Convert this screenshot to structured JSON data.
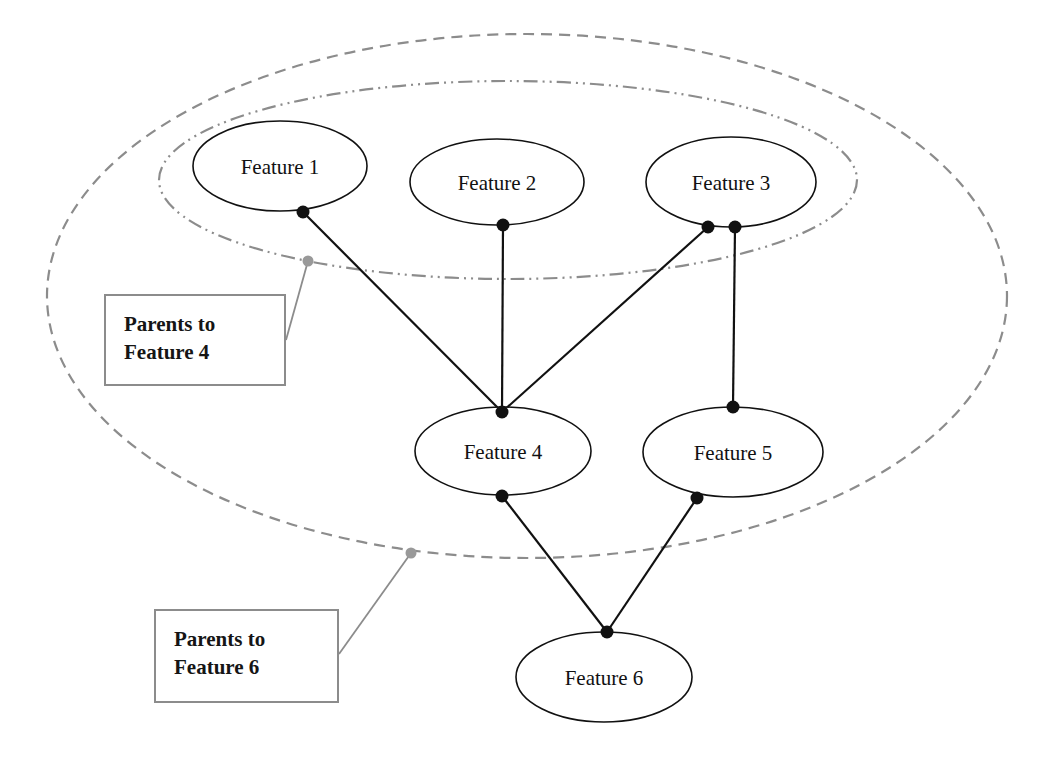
{
  "diagram": {
    "title": "",
    "nodes": [
      {
        "id": "f1",
        "label": "Feature 1",
        "cx": 280,
        "cy": 166,
        "rx": 87,
        "ry": 45
      },
      {
        "id": "f2",
        "label": "Feature 2",
        "cx": 497,
        "cy": 182,
        "rx": 87,
        "ry": 43
      },
      {
        "id": "f3",
        "label": "Feature 3",
        "cx": 731,
        "cy": 182,
        "rx": 85,
        "ry": 45
      },
      {
        "id": "f4",
        "label": "Feature 4",
        "cx": 503,
        "cy": 451,
        "rx": 88,
        "ry": 44
      },
      {
        "id": "f5",
        "label": "Feature 5",
        "cx": 733,
        "cy": 452,
        "rx": 90,
        "ry": 45
      },
      {
        "id": "f6",
        "label": "Feature 6",
        "cx": 604,
        "cy": 677,
        "rx": 88,
        "ry": 45
      }
    ],
    "edges": [
      {
        "from": "Feature 1",
        "to": "Feature 4",
        "x1": 303,
        "y1": 212,
        "x2": 502,
        "y2": 412
      },
      {
        "from": "Feature 2",
        "to": "Feature 4",
        "x1": 503,
        "y1": 225,
        "x2": 502,
        "y2": 412
      },
      {
        "from": "Feature 3",
        "to": "Feature 4",
        "x1": 708,
        "y1": 227,
        "x2": 502,
        "y2": 412
      },
      {
        "from": "Feature 3",
        "to": "Feature 5",
        "x1": 735,
        "y1": 227,
        "x2": 733,
        "y2": 407
      },
      {
        "from": "Feature 4",
        "to": "Feature 6",
        "x1": 502,
        "y1": 496,
        "x2": 607,
        "y2": 632
      },
      {
        "from": "Feature 5",
        "to": "Feature 6",
        "x1": 697,
        "y1": 498,
        "x2": 607,
        "y2": 632
      }
    ],
    "ports": [
      {
        "x": 303,
        "y": 212
      },
      {
        "x": 503,
        "y": 225
      },
      {
        "x": 708,
        "y": 227
      },
      {
        "x": 735,
        "y": 227
      },
      {
        "x": 502,
        "y": 412
      },
      {
        "x": 733,
        "y": 407
      },
      {
        "x": 502,
        "y": 496
      },
      {
        "x": 697,
        "y": 498
      },
      {
        "x": 607,
        "y": 632
      }
    ],
    "groups": [
      {
        "name": "parents-of-feature-4",
        "style": "dash-dot",
        "cx": 508,
        "cy": 180,
        "rx": 349,
        "ry": 99
      },
      {
        "name": "parents-of-feature-6",
        "style": "dashed",
        "cx": 527,
        "cy": 296,
        "rx": 480,
        "ry": 262
      }
    ],
    "callouts": [
      {
        "line1": "Parents to",
        "line2": "Feature 4",
        "box": {
          "x": 104,
          "y": 294,
          "w": 182,
          "h": 92
        },
        "dot": {
          "x": 308,
          "y": 261
        },
        "line_from": {
          "x": 286,
          "y": 340
        }
      },
      {
        "line1": "Parents to",
        "line2": "Feature 6",
        "box": {
          "x": 154,
          "y": 609,
          "w": 185,
          "h": 94
        },
        "dot": {
          "x": 411,
          "y": 553
        },
        "line_from": {
          "x": 339,
          "y": 654
        }
      }
    ]
  }
}
